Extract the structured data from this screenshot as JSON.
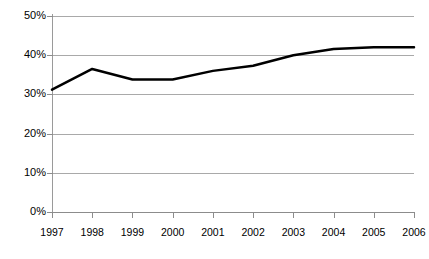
{
  "chart_data": {
    "type": "line",
    "title": "",
    "subtitle": "",
    "xlabel": "",
    "ylabel": "",
    "categories": [
      "1997",
      "1998",
      "1999",
      "2000",
      "2001",
      "2002",
      "2003",
      "2004",
      "2005",
      "2006"
    ],
    "x": [
      1997,
      1998,
      1999,
      2000,
      2001,
      2002,
      2003,
      2004,
      2005,
      2006
    ],
    "series": [
      {
        "name": "",
        "values": [
          31.2,
          36.5,
          33.8,
          33.8,
          36.0,
          37.3,
          40.0,
          41.6,
          42.0,
          42.0
        ],
        "color": "#000000",
        "line_width": 2.5
      }
    ],
    "ylim": [
      0,
      50
    ],
    "xlim": [
      1997,
      2006
    ],
    "ytick_labels": [
      "0%",
      "10%",
      "20%",
      "30%",
      "40%",
      "50%"
    ],
    "ytick_values": [
      0,
      10,
      20,
      30,
      40,
      50
    ],
    "xtick_labels": [
      "1997",
      "1998",
      "1999",
      "2000",
      "2001",
      "2002",
      "2003",
      "2004",
      "2005",
      "2006"
    ],
    "grid": true,
    "grid_axis": "y",
    "grid_color": "#a9a9a9",
    "legend": false,
    "legend_position": "none",
    "background_color": "#ffffff",
    "axis_color": "#8c8c8c",
    "annotations": []
  },
  "axes": {
    "y_labels": [
      {
        "text": "50%",
        "value": 50
      },
      {
        "text": "40%",
        "value": 40
      },
      {
        "text": "30%",
        "value": 30
      },
      {
        "text": "20%",
        "value": 20
      },
      {
        "text": "10%",
        "value": 10
      },
      {
        "text": "0%",
        "value": 0
      }
    ],
    "x_labels": [
      {
        "text": "1997",
        "value": 1997
      },
      {
        "text": "1998",
        "value": 1998
      },
      {
        "text": "1999",
        "value": 1999
      },
      {
        "text": "2000",
        "value": 2000
      },
      {
        "text": "2001",
        "value": 2001
      },
      {
        "text": "2002",
        "value": 2002
      },
      {
        "text": "2003",
        "value": 2003
      },
      {
        "text": "2004",
        "value": 2004
      },
      {
        "text": "2005",
        "value": 2005
      },
      {
        "text": "2006",
        "value": 2006
      }
    ]
  }
}
